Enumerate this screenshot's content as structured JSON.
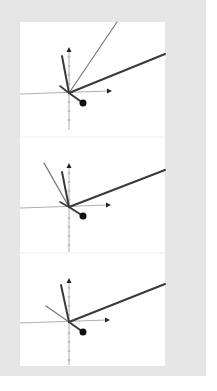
{
  "figure": {
    "frame_color": "#e6e6e6",
    "panel_color": "#ffffff",
    "axis_color": "#9a9a9a",
    "dark_line_color": "#3a3a3a",
    "light_line_color": "#7a7a7a",
    "divider_color": "#eeeeee",
    "panels": [
      {
        "name": "panel-1",
        "origin": [
          69,
          93
        ],
        "y_axis": {
          "top": 47,
          "bottom": 130
        },
        "x_axis": {
          "left": 20,
          "right": 112
        },
        "lines": [
          {
            "role": "light",
            "to": [
              117,
              22
            ],
            "width": 1.2
          },
          {
            "role": "dark",
            "to": [
              165,
              54
            ],
            "width": 2
          },
          {
            "role": "dark",
            "to": [
              62,
              56
            ],
            "width": 2
          },
          {
            "role": "dark",
            "to": [
              60,
              86
            ],
            "width": 1.6
          }
        ],
        "dot": [
          83,
          103
        ]
      },
      {
        "name": "panel-2",
        "origin": [
          69,
          207
        ],
        "y_axis": {
          "top": 163,
          "bottom": 252
        },
        "x_axis": {
          "left": 20,
          "right": 111
        },
        "lines": [
          {
            "role": "light",
            "to": [
              44,
              163
            ],
            "width": 1.4
          },
          {
            "role": "dark",
            "to": [
              165,
              170
            ],
            "width": 2
          },
          {
            "role": "dark",
            "to": [
              62,
              172
            ],
            "width": 2
          },
          {
            "role": "dark",
            "to": [
              60,
              202
            ],
            "width": 1.6
          }
        ],
        "dot": [
          83,
          216
        ]
      },
      {
        "name": "panel-3",
        "origin": [
          69,
          322
        ],
        "y_axis": {
          "top": 278,
          "bottom": 365
        },
        "x_axis": {
          "left": 20,
          "right": 110
        },
        "lines": [
          {
            "role": "light",
            "to": [
              46,
              306
            ],
            "width": 1.4
          },
          {
            "role": "dark",
            "to": [
              165,
              284
            ],
            "width": 2
          },
          {
            "role": "dark",
            "to": [
              61,
              285
            ],
            "width": 2
          }
        ],
        "dot": [
          83,
          332
        ]
      }
    ],
    "dividers": [
      137,
      253
    ]
  }
}
